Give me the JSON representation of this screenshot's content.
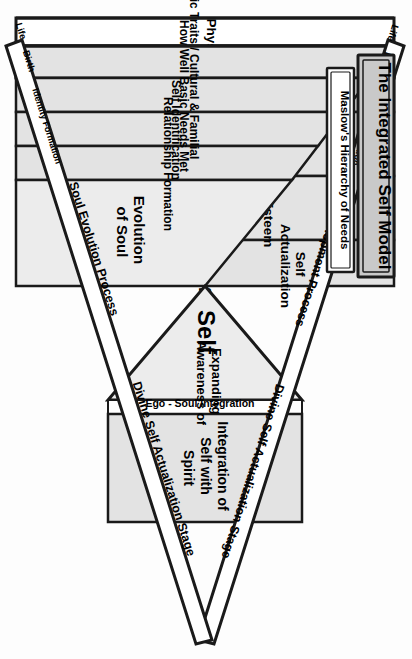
{
  "titles": {
    "main": "The Integrated Self Model",
    "sub": "Maslow's Hierarchy of Needs"
  },
  "axis": {
    "creation_of_life": "Creation of Life",
    "process_top": "Ego Development Process",
    "process_bottom": "Soul Evolution Process",
    "stage_top": "Divine Self Actualization Stage",
    "stage_bottom": "Divine Self Actualization Stage"
  },
  "timeline_top": [
    "Life",
    "Birth",
    "Identity Formation"
  ],
  "timeline_bottom": [
    "Life",
    "Birth",
    "Identity Formation"
  ],
  "ego_bands": [
    "Physiological",
    "Safety",
    "Longing & Belonging",
    "Self Esteem",
    "Self Actualization"
  ],
  "soul_bands": [
    "Genetic Traits / Cultural & Familial",
    "How Well Basic Needs Met",
    "Self Identification",
    "Relationship Formation"
  ],
  "inner": {
    "self": "Self",
    "expanding": "Expanding Awareness of",
    "evolution": "Evolution of Soul",
    "ego_soul": "Ego - Soul Integration",
    "integration": "Integration of Self with Spirit"
  },
  "colors": {
    "shade": "#e3e3e3",
    "shade_light": "#ececec",
    "line": "#1a1a1a",
    "gray_text": "#9b9b9b",
    "title_fill": "#c9c9c9",
    "paper": "#fdfdfd"
  }
}
